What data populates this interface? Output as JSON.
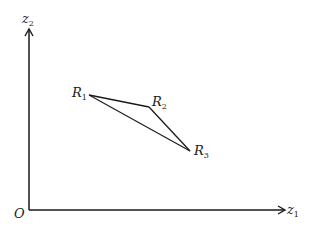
{
  "diagram": {
    "axes": {
      "origin_label": "O",
      "x_label": {
        "base": "z",
        "sub": "1"
      },
      "y_label": {
        "base": "z",
        "sub": "2"
      }
    },
    "points": [
      {
        "base": "R",
        "sub": "1",
        "x": 89,
        "y": 95
      },
      {
        "base": "R",
        "sub": "2",
        "x": 149,
        "y": 107
      },
      {
        "base": "R",
        "sub": "3",
        "x": 190,
        "y": 151
      }
    ],
    "edges": [
      [
        "R1",
        "R2"
      ],
      [
        "R2",
        "R3"
      ],
      [
        "R1",
        "R3"
      ]
    ],
    "stroke_color": "#1a1a1a"
  }
}
